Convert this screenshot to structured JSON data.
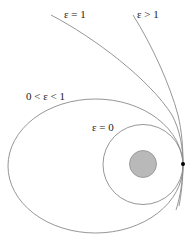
{
  "diagram": {
    "labels": {
      "parabola": "ε = 1",
      "hyperbola": "ε > 1",
      "ellipse": "0 < ε < 1",
      "circle": "ε = 0"
    },
    "colors": {
      "orbit_stroke": "#8a8a8a",
      "planet_fill": "#b9b9b9",
      "planet_stroke": "#8f8f8f",
      "perigee_point": "#000000",
      "text": "#222222"
    },
    "elements": {
      "planet": "central-body",
      "perigee": "common-periapsis-point"
    }
  }
}
